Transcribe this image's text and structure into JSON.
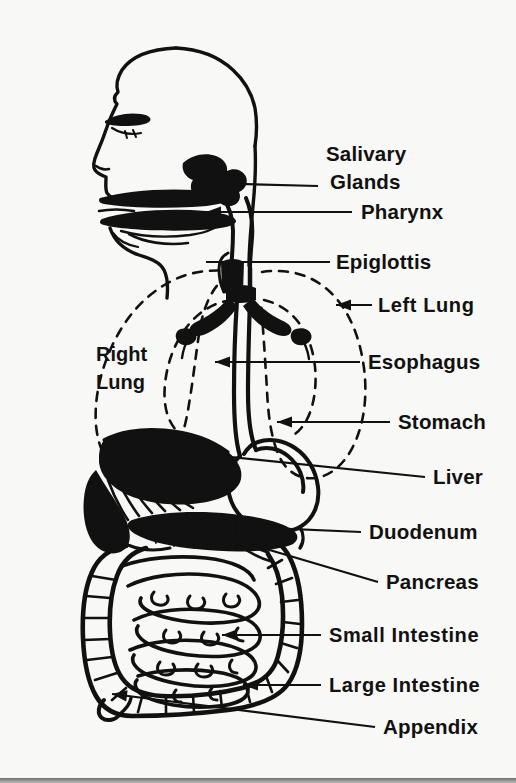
{
  "figure": {
    "style": "black-and-white line drawing",
    "background_color": "#f8f8f6",
    "ink_color": "#111111",
    "footer_band_color": "#8d8d8d"
  },
  "inner_labels": [
    {
      "id": "right-lung",
      "line1": "Right",
      "line2": "Lung",
      "x": 96,
      "y": 361
    }
  ],
  "labels": [
    {
      "id": "salivary-glands",
      "line1": "Salivary",
      "line2": "Glands",
      "x": 326,
      "y": 161,
      "y2": 189,
      "arrow": true,
      "tip_x": 206,
      "tip_y": 183,
      "elbow": [
        318,
        186
      ]
    },
    {
      "id": "pharynx",
      "line1": "Pharynx",
      "line2": "",
      "x": 361,
      "y": 219,
      "arrow": true,
      "tip_x": 206,
      "tip_y": 212,
      "elbow": [
        352,
        212
      ]
    },
    {
      "id": "epiglottis",
      "line1": "Epiglottis",
      "line2": "",
      "x": 336,
      "y": 269,
      "arrow": false,
      "tip_x": 206,
      "tip_y": 262,
      "elbow": [
        330,
        262
      ]
    },
    {
      "id": "left-lung",
      "line1": "Left Lung",
      "line2": "",
      "x": 378,
      "y": 312,
      "arrow": true,
      "tip_x": 336,
      "tip_y": 305,
      "elbow": [
        372,
        305
      ]
    },
    {
      "id": "esophagus",
      "line1": "Esophagus",
      "line2": "",
      "x": 368,
      "y": 369,
      "arrow": true,
      "tip_x": 215,
      "tip_y": 362,
      "elbow": [
        360,
        362
      ]
    },
    {
      "id": "stomach",
      "line1": "Stomach",
      "line2": "",
      "x": 398,
      "y": 429,
      "arrow": true,
      "tip_x": 277,
      "tip_y": 422,
      "elbow": [
        390,
        422
      ]
    },
    {
      "id": "liver",
      "line1": "Liver",
      "line2": "",
      "x": 433,
      "y": 484,
      "arrow": false,
      "tip_x": 183,
      "tip_y": 452,
      "elbow": [
        425,
        477
      ]
    },
    {
      "id": "duodenum",
      "line1": "Duodenum",
      "line2": "",
      "x": 369,
      "y": 539,
      "arrow": false,
      "tip_x": 243,
      "tip_y": 527,
      "elbow": [
        361,
        532
      ]
    },
    {
      "id": "pancreas",
      "line1": "Pancreas",
      "line2": "",
      "x": 386,
      "y": 589,
      "arrow": false,
      "tip_x": 246,
      "tip_y": 543,
      "elbow": [
        378,
        582
      ]
    },
    {
      "id": "small-intestine",
      "line1": "Small Intestine",
      "line2": "",
      "x": 329,
      "y": 642,
      "arrow": true,
      "tip_x": 222,
      "tip_y": 635,
      "elbow": [
        321,
        635
      ]
    },
    {
      "id": "large-intestine",
      "line1": "Large Intestine",
      "line2": "",
      "x": 329,
      "y": 692,
      "arrow": true,
      "tip_x": 243,
      "tip_y": 685,
      "elbow": [
        321,
        685
      ]
    },
    {
      "id": "appendix",
      "line1": "Appendix",
      "line2": "",
      "x": 383,
      "y": 734,
      "arrow": true,
      "tip_x": 112,
      "tip_y": 694,
      "elbow": [
        375,
        727
      ]
    }
  ],
  "organs": [
    "head-profile",
    "eye",
    "nose",
    "mouth",
    "tongue",
    "salivary-gland-mass",
    "pharynx-passage",
    "epiglottis-flap",
    "trachea",
    "bronchi",
    "left-lung-outline",
    "right-lung-outline",
    "esophagus-tube",
    "stomach",
    "liver",
    "duodenum",
    "pancreas",
    "small-intestine",
    "large-intestine",
    "appendix"
  ]
}
